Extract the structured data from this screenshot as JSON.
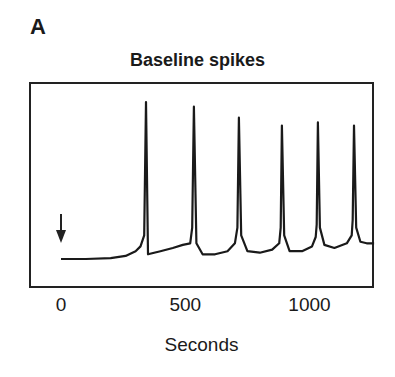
{
  "panel_label": "A",
  "chart_data": {
    "type": "line",
    "title": "Baseline spikes",
    "xlabel": "Seconds",
    "ylabel": "",
    "xlim": [
      0,
      1260
    ],
    "x_ticks": [
      0,
      500,
      1000
    ],
    "x_tick_labels": [
      "0",
      "500",
      "1000"
    ],
    "grid": false,
    "legend": null,
    "annotations": [
      {
        "type": "arrow-down",
        "x": 0,
        "label": "stimulus onset"
      }
    ],
    "series": [
      {
        "name": "trace",
        "units": "normalized amplitude (0 = baseline, 1 = first spike peak)",
        "points": [
          [
            0,
            0.0
          ],
          [
            100,
            0.0
          ],
          [
            200,
            0.005
          ],
          [
            260,
            0.02
          ],
          [
            300,
            0.05
          ],
          [
            320,
            0.08
          ],
          [
            335,
            0.15
          ],
          [
            342,
            1.0
          ],
          [
            350,
            0.03
          ],
          [
            400,
            0.05
          ],
          [
            450,
            0.07
          ],
          [
            490,
            0.09
          ],
          [
            520,
            0.1
          ],
          [
            528,
            0.2
          ],
          [
            535,
            0.97
          ],
          [
            545,
            0.1
          ],
          [
            570,
            0.03
          ],
          [
            620,
            0.03
          ],
          [
            670,
            0.05
          ],
          [
            700,
            0.1
          ],
          [
            710,
            0.2
          ],
          [
            716,
            0.9
          ],
          [
            725,
            0.15
          ],
          [
            750,
            0.05
          ],
          [
            800,
            0.04
          ],
          [
            850,
            0.06
          ],
          [
            878,
            0.1
          ],
          [
            884,
            0.2
          ],
          [
            889,
            0.85
          ],
          [
            898,
            0.15
          ],
          [
            920,
            0.05
          ],
          [
            970,
            0.05
          ],
          [
            1010,
            0.08
          ],
          [
            1025,
            0.14
          ],
          [
            1029,
            0.22
          ],
          [
            1034,
            0.87
          ],
          [
            1042,
            0.2
          ],
          [
            1060,
            0.09
          ],
          [
            1100,
            0.07
          ],
          [
            1150,
            0.1
          ],
          [
            1170,
            0.15
          ],
          [
            1174,
            0.25
          ],
          [
            1179,
            0.85
          ],
          [
            1188,
            0.2
          ],
          [
            1205,
            0.11
          ],
          [
            1230,
            0.1
          ],
          [
            1260,
            0.1
          ]
        ],
        "spike_peaks": [
          {
            "t": 342,
            "amp": 1.0
          },
          {
            "t": 535,
            "amp": 0.97
          },
          {
            "t": 716,
            "amp": 0.9
          },
          {
            "t": 889,
            "amp": 0.85
          },
          {
            "t": 1034,
            "amp": 0.87
          },
          {
            "t": 1179,
            "amp": 0.85
          }
        ]
      }
    ]
  }
}
